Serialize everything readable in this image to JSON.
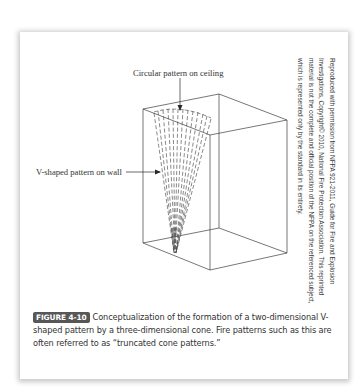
{
  "figure": {
    "labels": {
      "ceiling": "Circular pattern on ceiling",
      "wall": "V-shaped pattern on wall"
    },
    "credit": "Reproduced with permission from NFPA 921-2011, Guide for Fire and Explosion Investigations, Copyright© 2010, National Fire Protection Association. This reprinted material is not the complete and official position of the NFPA on the referenced subject, which is represented only by the standard in its entirety.",
    "caption": {
      "badge": "FIGURE 4-10",
      "text": "Conceptualization of the formation of a two-dimensional V-shaped pattern by a three-dimensional cone. Fire patterns such as this are often referred to as “truncated cone patterns.”"
    },
    "colors": {
      "line": "#3c3c3c",
      "badge_bg": "#575757",
      "badge_text": "#ffffff",
      "text": "#333333"
    },
    "icons": [
      "arrow-down-icon",
      "arrow-right-icon"
    ]
  }
}
